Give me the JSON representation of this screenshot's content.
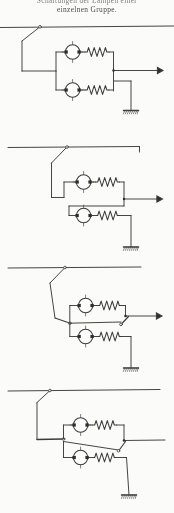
{
  "page": {
    "background_color": "#fdfdfb",
    "ink_color": "#3a3a38",
    "width": 174,
    "height": 513
  },
  "caption": {
    "line1": "Schaltungen der Lampen einer",
    "line2": "einzelnen Gruppe."
  },
  "figure": {
    "kind": "electrical-circuit-schematic",
    "language": "de",
    "diagram_count": 4,
    "symbols": {
      "lamp": "circle-with-cross",
      "resistor": "zigzag-coil",
      "switch": "knife-switch",
      "ground": "hatched-earth-bar",
      "terminal": "filled-arrowhead"
    },
    "diagrams": [
      {
        "index": 1,
        "name": "schaltung-1",
        "label": "Zwei Lampen parallel mit Widerstaenden",
        "rail_y": 27,
        "lamps": 2,
        "resistors": 2,
        "switches": 1,
        "grounds": 1,
        "terminals": 1
      },
      {
        "index": 2,
        "name": "schaltung-2",
        "label": "Zwei Lampen in Reihe geschaltet",
        "rail_y": 147,
        "lamps": 2,
        "resistors": 2,
        "switches": 1,
        "grounds": 1,
        "terminals": 1
      },
      {
        "index": 3,
        "name": "schaltung-3",
        "label": "Umschaltung mit zwei Schaltern",
        "rail_y": 267,
        "lamps": 2,
        "resistors": 2,
        "switches": 3,
        "grounds": 1,
        "terminals": 1
      },
      {
        "index": 4,
        "name": "schaltung-4",
        "label": "Gruppenschaltung mit Erdung",
        "rail_y": 390,
        "lamps": 2,
        "resistors": 2,
        "switches": 3,
        "grounds": 1,
        "terminals": 1
      }
    ]
  }
}
